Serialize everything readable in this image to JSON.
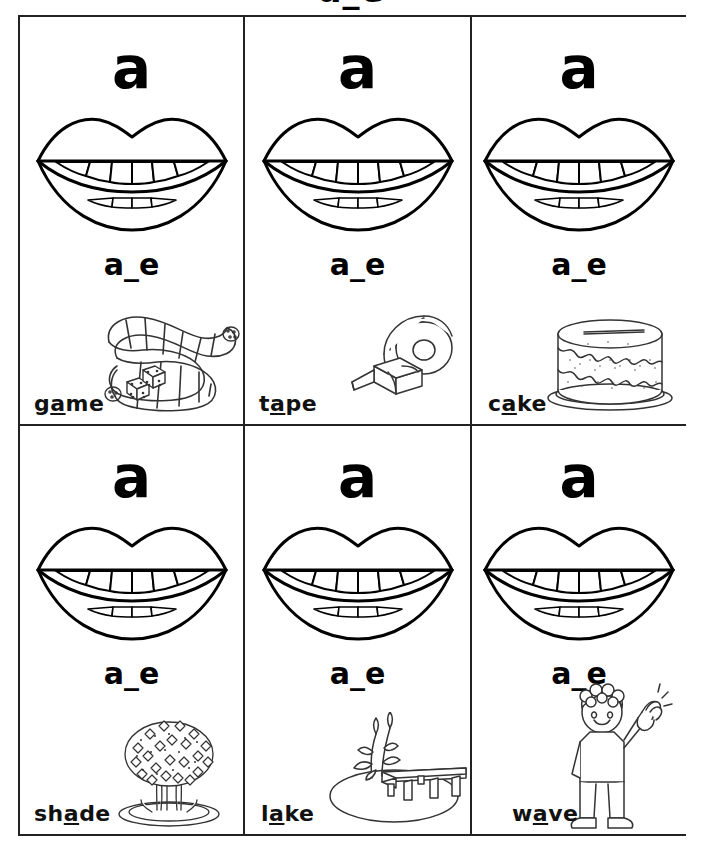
{
  "page": {
    "title_partial": "a_e",
    "vowel_letter": "a",
    "pattern": "a_e"
  },
  "cards": [
    {
      "id": "game",
      "vowel": "a",
      "pattern": "a_e",
      "word_before": "g",
      "word_vowel": "a",
      "word_after": "me",
      "word_full": "game",
      "picture": "snake-and-dice-board-game-icon"
    },
    {
      "id": "tape",
      "vowel": "a",
      "pattern": "a_e",
      "word_before": "t",
      "word_vowel": "a",
      "word_after": "pe",
      "word_full": "tape",
      "picture": "tape-dispenser-icon"
    },
    {
      "id": "cake",
      "vowel": "a",
      "pattern": "a_e",
      "word_before": "c",
      "word_vowel": "a",
      "word_after": "ke",
      "word_full": "cake",
      "picture": "cake-icon"
    },
    {
      "id": "shade",
      "vowel": "a",
      "pattern": "a_e",
      "word_before": "sh",
      "word_vowel": "a",
      "word_after": "de",
      "word_full": "shade",
      "picture": "tree-icon"
    },
    {
      "id": "lake",
      "vowel": "a",
      "pattern": "a_e",
      "word_before": "l",
      "word_vowel": "a",
      "word_after": "ke",
      "word_full": "lake",
      "picture": "lake-dock-reeds-icon"
    },
    {
      "id": "wave",
      "vowel": "a",
      "pattern": "a_e",
      "word_before": "w",
      "word_vowel": "a",
      "word_after": "ve",
      "word_full": "wave",
      "picture": "waving-child-icon"
    }
  ],
  "colors": {
    "ink": "#000000",
    "border": "#222222",
    "paper": "#ffffff"
  }
}
